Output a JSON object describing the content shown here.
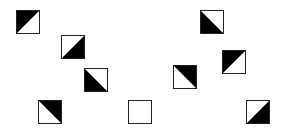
{
  "diagram": {
    "fill_color": "#000000",
    "border_color": "#222222",
    "background": "#ffffff",
    "tiles": [
      {
        "id": 1,
        "x": 16,
        "y": 10,
        "filled": "top-left"
      },
      {
        "id": 2,
        "x": 61,
        "y": 35,
        "filled": "bottom-right"
      },
      {
        "id": 3,
        "x": 84,
        "y": 68,
        "filled": "bottom-left"
      },
      {
        "id": 4,
        "x": 38,
        "y": 100,
        "filled": "top-right"
      },
      {
        "id": 5,
        "x": 128,
        "y": 100,
        "filled": "none"
      },
      {
        "id": 6,
        "x": 173,
        "y": 65,
        "filled": "top-right"
      },
      {
        "id": 7,
        "x": 200,
        "y": 10,
        "filled": "bottom-left"
      },
      {
        "id": 8,
        "x": 222,
        "y": 50,
        "filled": "top-left"
      },
      {
        "id": 9,
        "x": 246,
        "y": 100,
        "filled": "bottom-right"
      }
    ]
  }
}
